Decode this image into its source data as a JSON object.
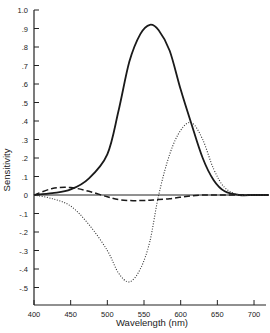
{
  "chart_data": {
    "type": "line",
    "title": "",
    "xlabel": "Wavelength (nm)",
    "ylabel": "Sensitivity",
    "xlim": [
      400,
      720
    ],
    "ylim": [
      -0.6,
      1.0
    ],
    "grid": false,
    "legend": "none",
    "x_ticks": [
      400,
      450,
      500,
      550,
      600,
      650,
      700
    ],
    "x_tick_labels": [
      "400",
      "450",
      "500",
      "550",
      "600",
      "650",
      "700"
    ],
    "y_ticks": [
      1.0,
      0.9,
      0.8,
      0.7,
      0.6,
      0.5,
      0.4,
      0.3,
      0.2,
      0.1,
      0,
      -0.1,
      -0.2,
      -0.3,
      -0.4,
      -0.5
    ],
    "y_tick_labels": [
      "1.0",
      ".9",
      ".8",
      ".7",
      ".6",
      ".5",
      ".4",
      ".3",
      ".2",
      ".1",
      "0",
      "-.1",
      "-.2",
      "-.3",
      "-.4",
      "-.5"
    ],
    "x": [
      400,
      425,
      450,
      475,
      500,
      515,
      530,
      545,
      558,
      570,
      585,
      600,
      615,
      630,
      645,
      660,
      680,
      700,
      720
    ],
    "series": [
      {
        "name": "solid",
        "style": "solid",
        "values": [
          0.0,
          0.01,
          0.03,
          0.09,
          0.22,
          0.45,
          0.72,
          0.87,
          0.92,
          0.89,
          0.78,
          0.57,
          0.38,
          0.2,
          0.08,
          0.02,
          0.0,
          0.0,
          0.0
        ]
      },
      {
        "name": "dashed",
        "style": "dashed",
        "values": [
          0.0,
          0.035,
          0.04,
          0.02,
          -0.01,
          -0.025,
          -0.03,
          -0.03,
          -0.028,
          -0.025,
          -0.02,
          -0.012,
          -0.005,
          0.0,
          0.0,
          0.0,
          0.0,
          0.0,
          0.0
        ]
      },
      {
        "name": "dotted",
        "style": "dotted",
        "values": [
          0.0,
          -0.02,
          -0.06,
          -0.16,
          -0.3,
          -0.42,
          -0.47,
          -0.4,
          -0.25,
          0.0,
          0.22,
          0.35,
          0.39,
          0.3,
          0.14,
          0.04,
          0.0,
          0.0,
          0.0
        ]
      }
    ]
  }
}
